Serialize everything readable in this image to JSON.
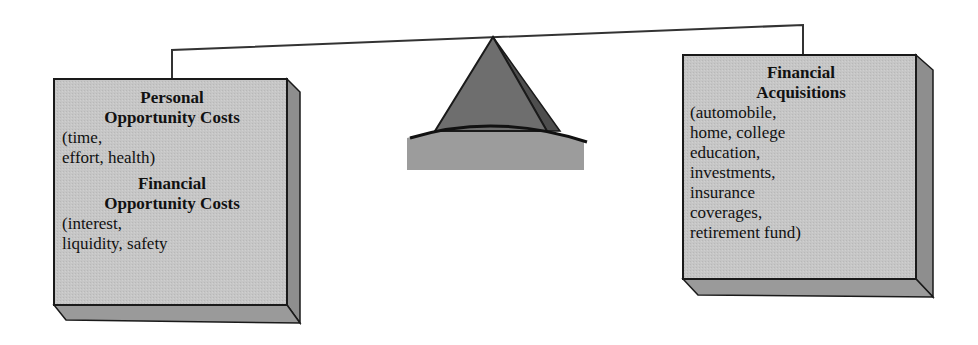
{
  "left_box": {
    "personal_heading_line1": "Personal",
    "personal_heading_line2": "Opportunity Costs",
    "personal_detail_line1": "(time,",
    "personal_detail_line2": "effort, health)",
    "financial_heading_line1": "Financial",
    "financial_heading_line2": "Opportunity Costs",
    "financial_detail_line1": "(interest,",
    "financial_detail_line2": "liquidity, safety"
  },
  "right_box": {
    "heading_line1": "Financial",
    "heading_line2": "Acquisitions",
    "detail_lines": [
      "(automobile,",
      "home, college",
      "education,",
      "investments,",
      "insurance",
      "coverages,",
      "retirement fund)"
    ]
  },
  "colors": {
    "box_face": "#c4c4c4",
    "box_side": "#8e8e8e",
    "box_bottom": "#9a9a9a",
    "outline": "#1a1a1a",
    "fulcrum_face": "#6e6e6e",
    "fulcrum_side": "#4e4e4e",
    "fulcrum_base": "#9c9c9c"
  }
}
